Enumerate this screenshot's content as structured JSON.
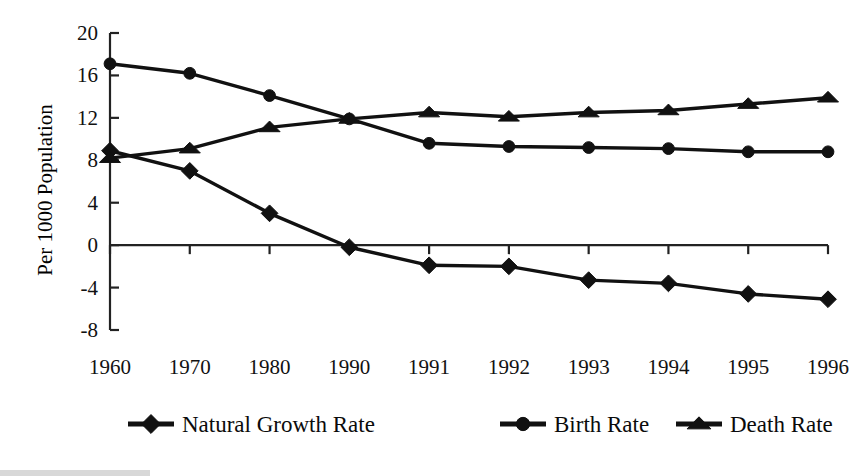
{
  "chart_data": {
    "type": "line",
    "title": "",
    "xlabel": "",
    "ylabel": "Per 1000 Population",
    "categories": [
      "1960",
      "1970",
      "1980",
      "1990",
      "1991",
      "1992",
      "1993",
      "1994",
      "1995",
      "1996"
    ],
    "ylim": [
      -8,
      20
    ],
    "yticks": [
      20,
      16,
      12,
      8,
      4,
      0,
      -4,
      -8
    ],
    "ytick_labels": [
      "20",
      "16",
      "12",
      "8",
      "4",
      "0",
      "-4",
      "-8"
    ],
    "grid": false,
    "legend_position": "bottom",
    "series": [
      {
        "name": "Natural Growth Rate",
        "marker": "diamond",
        "color": "#111111",
        "values": [
          8.9,
          7.0,
          3.0,
          -0.2,
          -1.9,
          -2.0,
          -3.3,
          -3.6,
          -4.6,
          -5.1
        ]
      },
      {
        "name": "Birth Rate",
        "marker": "circle",
        "color": "#111111",
        "values": [
          17.1,
          16.2,
          14.1,
          11.9,
          9.6,
          9.3,
          9.2,
          9.1,
          8.8,
          8.8
        ]
      },
      {
        "name": "Death Rate",
        "marker": "triangle",
        "color": "#111111",
        "values": [
          8.2,
          9.1,
          11.1,
          11.9,
          12.5,
          12.1,
          12.5,
          12.7,
          13.3,
          13.9
        ]
      }
    ]
  },
  "legend": {
    "items": [
      {
        "label": "Natural Growth Rate",
        "marker": "diamond"
      },
      {
        "label": "Birth Rate",
        "marker": "circle"
      },
      {
        "label": "Death Rate",
        "marker": "triangle"
      }
    ]
  },
  "axes": {
    "y_title": "Per 1000 Population"
  },
  "colors": {
    "ink": "#111111",
    "background": "#ffffff"
  }
}
